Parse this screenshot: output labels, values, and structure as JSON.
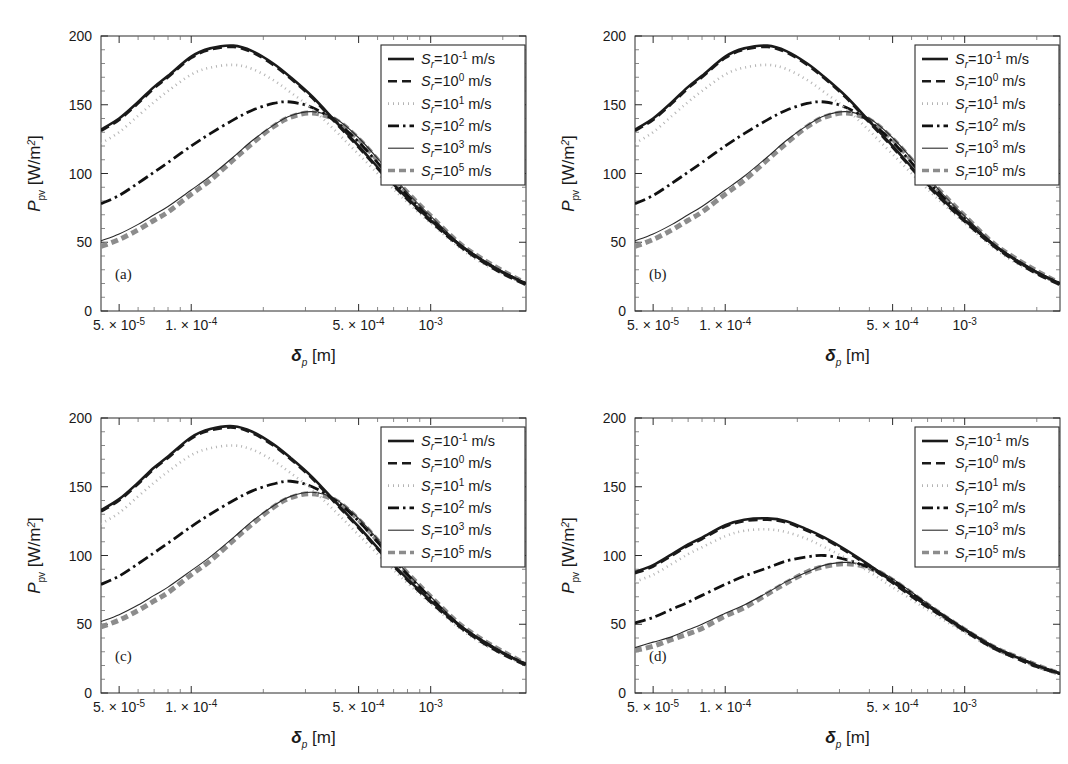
{
  "figure": {
    "panel_count": 4,
    "background": "#ffffff",
    "foreground": "#1a1a1a"
  },
  "axis": {
    "ylabel_main": "P",
    "ylabel_sub": "pv",
    "ylabel_units": "[W/m",
    "ylabel_units_sup": "2",
    "ylabel_units_close": "]",
    "xlabel_main": "δ",
    "xlabel_sub": "p",
    "xlabel_units": "[m]",
    "y_ticks": [
      0,
      50,
      100,
      150,
      200
    ],
    "y_tick_labels": [
      "0",
      "50",
      "100",
      "150",
      "200"
    ],
    "ylim": [
      0,
      200
    ],
    "xlim": [
      4.2e-05,
      0.0025
    ],
    "x_scale": "log",
    "x_ticks": [
      5e-05,
      0.0001,
      0.0005,
      0.001
    ],
    "x_tick_labels": [
      {
        "mantissa": "5. × 10",
        "exp": "-5"
      },
      {
        "mantissa": "1. × 10",
        "exp": "-4"
      },
      {
        "mantissa": "5. × 10",
        "exp": "-4"
      },
      {
        "mantissa": "10",
        "exp": "-3"
      }
    ],
    "grid": false
  },
  "legend": {
    "position": "top-right",
    "var_symbol": "S",
    "var_sub": "r",
    "equals": "=",
    "base": "10",
    "units": "m/s",
    "entries": [
      {
        "exp": "-1",
        "label": "S_r = 10^-1 m/s",
        "style": "solid",
        "color": "#1a1a1a",
        "width": 2.6,
        "dash": "none"
      },
      {
        "exp": "0",
        "label": "S_r = 10^0 m/s",
        "style": "dashed",
        "color": "#1a1a1a",
        "width": 2.6,
        "dash": "9,5"
      },
      {
        "exp": "1",
        "label": "S_r = 10^1 m/s",
        "style": "dotted",
        "color": "#b4b4b4",
        "width": 2.6,
        "dash": "1,4"
      },
      {
        "exp": "2",
        "label": "S_r = 10^2 m/s",
        "style": "dash-dot",
        "color": "#111111",
        "width": 2.8,
        "dash": "11,4,2.5,4"
      },
      {
        "exp": "3",
        "label": "S_r = 10^3 m/s",
        "style": "thin-solid",
        "color": "#2b2b2b",
        "width": 1.1,
        "dash": "none"
      },
      {
        "exp": "5",
        "label": "S_r = 10^5 m/s",
        "style": "thick-dashed",
        "color": "#8c8c8c",
        "width": 5.0,
        "dash": "7,4"
      }
    ]
  },
  "chart_data": {
    "type": "line",
    "xlabel": "δ_p [m]",
    "ylabel": "P_pv [W/m^2]",
    "x_scale": "log",
    "xlim": [
      4.2e-05,
      0.0025
    ],
    "ylim": [
      0,
      200
    ],
    "x": [
      4.2e-05,
      5e-05,
      6e-05,
      7e-05,
      8e-05,
      0.0001,
      0.00012,
      0.00015,
      0.00018,
      0.00022,
      0.00026,
      0.00032,
      0.0004,
      0.0005,
      0.00065,
      0.0008,
      0.001,
      0.0013,
      0.0016,
      0.002,
      0.0025
    ],
    "panels": [
      {
        "id": "a",
        "label": "(a)",
        "series": [
          {
            "name": "S_r = 10^-1 m/s",
            "values": [
              132,
              140,
              152,
              163,
              171,
              185,
              191,
              193,
              189,
              180,
              170,
              156,
              138,
              120,
              98,
              82,
              66,
              49,
              38,
              28,
              20
            ]
          },
          {
            "name": "S_r = 10^0 m/s",
            "values": [
              131,
              139,
              151,
              162,
              170,
              184,
              190,
              192,
              188,
              179,
              169,
              155,
              137,
              119,
              97,
              81,
              65,
              48,
              37,
              27,
              19
            ]
          },
          {
            "name": "S_r = 10^1 m/s",
            "values": [
              122,
              130,
              142,
              152,
              160,
              172,
              177,
              179,
              176,
              168,
              159,
              147,
              131,
              114,
              94,
              79,
              64,
              47,
              36,
              27,
              19
            ]
          },
          {
            "name": "S_r = 10^2 m/s",
            "values": [
              78,
              84,
              93,
              101,
              108,
              120,
              129,
              139,
              146,
              151,
              152,
              148,
              138,
              123,
              101,
              84,
              67,
              49,
              38,
              28,
              20
            ]
          },
          {
            "name": "S_r = 10^3 m/s",
            "values": [
              51,
              56,
              63,
              70,
              76,
              88,
              98,
              112,
              124,
              135,
              142,
              145,
              140,
              126,
              104,
              86,
              69,
              50,
              39,
              29,
              20
            ]
          },
          {
            "name": "S_r = 10^5 m/s",
            "values": [
              47,
              52,
              59,
              66,
              72,
              85,
              95,
              110,
              122,
              134,
              141,
              144,
              139,
              125,
              103,
              86,
              69,
              50,
              39,
              29,
              20
            ]
          }
        ]
      },
      {
        "id": "b",
        "label": "(b)",
        "series": [
          {
            "name": "S_r = 10^-1 m/s",
            "values": [
              132,
              140,
              152,
              163,
              171,
              185,
              191,
              193,
              189,
              180,
              170,
              156,
              138,
              120,
              98,
              82,
              66,
              49,
              38,
              28,
              20
            ]
          },
          {
            "name": "S_r = 10^0 m/s",
            "values": [
              131,
              139,
              151,
              162,
              170,
              184,
              190,
              192,
              188,
              179,
              169,
              155,
              137,
              119,
              97,
              81,
              65,
              48,
              37,
              27,
              19
            ]
          },
          {
            "name": "S_r = 10^1 m/s",
            "values": [
              122,
              130,
              142,
              152,
              160,
              172,
              177,
              179,
              176,
              168,
              159,
              147,
              131,
              114,
              94,
              79,
              64,
              47,
              36,
              27,
              19
            ]
          },
          {
            "name": "S_r = 10^2 m/s",
            "values": [
              78,
              84,
              93,
              101,
              108,
              120,
              129,
              139,
              146,
              151,
              152,
              148,
              138,
              123,
              101,
              84,
              67,
              49,
              38,
              28,
              20
            ]
          },
          {
            "name": "S_r = 10^3 m/s",
            "values": [
              51,
              56,
              63,
              70,
              76,
              88,
              98,
              112,
              124,
              135,
              142,
              145,
              140,
              126,
              104,
              86,
              69,
              50,
              39,
              29,
              20
            ]
          },
          {
            "name": "S_r = 10^5 m/s",
            "values": [
              47,
              52,
              59,
              66,
              72,
              85,
              95,
              110,
              122,
              134,
              141,
              144,
              139,
              125,
              103,
              86,
              69,
              50,
              39,
              29,
              20
            ]
          }
        ]
      },
      {
        "id": "c",
        "label": "(c)",
        "series": [
          {
            "name": "S_r = 10^-1 m/s",
            "values": [
              133,
              141,
              153,
              164,
              172,
              186,
              192,
              194,
              190,
              181,
              171,
              157,
              139,
              121,
              99,
              83,
              67,
              50,
              39,
              29,
              21
            ]
          },
          {
            "name": "S_r = 10^0 m/s",
            "values": [
              132,
              140,
              152,
              163,
              171,
              185,
              191,
              193,
              189,
              180,
              170,
              156,
              138,
              120,
              98,
              82,
              66,
              49,
              38,
              28,
              20
            ]
          },
          {
            "name": "S_r = 10^1 m/s",
            "values": [
              123,
              131,
              143,
              153,
              161,
              173,
              178,
              180,
              177,
              169,
              160,
              148,
              132,
              115,
              95,
              80,
              65,
              48,
              37,
              28,
              20
            ]
          },
          {
            "name": "S_r = 10^2 m/s",
            "values": [
              79,
              85,
              94,
              102,
              109,
              121,
              130,
              140,
              147,
              152,
              154,
              150,
              140,
              125,
              103,
              86,
              69,
              50,
              39,
              29,
              21
            ]
          },
          {
            "name": "S_r = 10^3 m/s",
            "values": [
              52,
              57,
              64,
              71,
              77,
              89,
              99,
              113,
              125,
              136,
              143,
              146,
              141,
              127,
              105,
              87,
              70,
              51,
              40,
              30,
              21
            ]
          },
          {
            "name": "S_r = 10^5 m/s",
            "values": [
              48,
              53,
              60,
              67,
              73,
              86,
              96,
              111,
              123,
              135,
              142,
              145,
              140,
              126,
              104,
              87,
              70,
              51,
              40,
              30,
              21
            ]
          }
        ]
      },
      {
        "id": "d",
        "label": "(d)",
        "series": [
          {
            "name": "S_r = 10^-1 m/s",
            "values": [
              88,
              93,
              101,
              108,
              113,
              122,
              126,
              127,
              125,
              119,
              113,
              104,
              93,
              81,
              67,
              57,
              46,
              34,
              27,
              20,
              14
            ]
          },
          {
            "name": "S_r = 10^0 m/s",
            "values": [
              87,
              92,
              100,
              107,
              112,
              121,
              125,
              126,
              124,
              118,
              112,
              103,
              92,
              80,
              66,
              56,
              45,
              33,
              26,
              19,
              14
            ]
          },
          {
            "name": "S_r = 10^1 m/s",
            "values": [
              81,
              86,
              94,
              101,
              106,
              114,
              118,
              119,
              117,
              112,
              106,
              98,
              88,
              77,
              64,
              54,
              44,
              33,
              26,
              19,
              14
            ]
          },
          {
            "name": "S_r = 10^2 m/s",
            "values": [
              51,
              55,
              61,
              66,
              71,
              79,
              85,
              91,
              96,
              99,
              100,
              97,
              91,
              82,
              68,
              57,
              46,
              34,
              27,
              20,
              14
            ]
          },
          {
            "name": "S_r = 10^3 m/s",
            "values": [
              33,
              37,
              41,
              46,
              50,
              58,
              64,
              73,
              81,
              88,
              93,
              95,
              92,
              83,
              69,
              58,
              47,
              35,
              27,
              20,
              15
            ]
          },
          {
            "name": "S_r = 10^5 m/s",
            "values": [
              31,
              34,
              39,
              43,
              47,
              56,
              62,
              72,
              80,
              88,
              92,
              94,
              91,
              82,
              68,
              57,
              46,
              34,
              27,
              20,
              14
            ]
          }
        ]
      }
    ]
  }
}
